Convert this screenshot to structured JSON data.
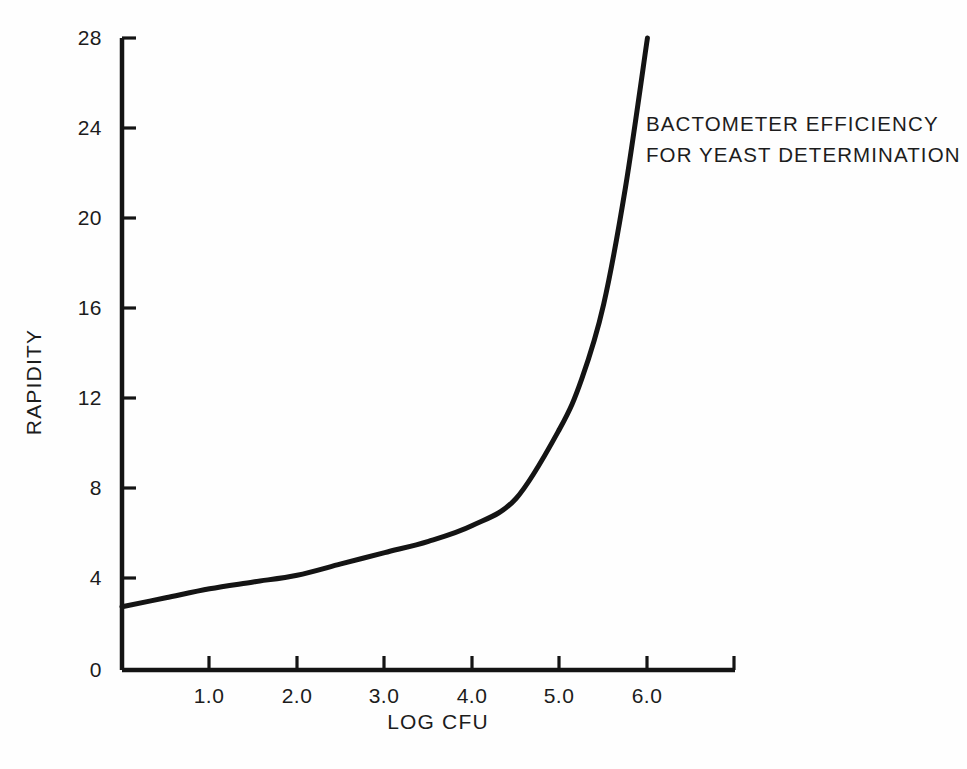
{
  "chart_data": {
    "type": "line",
    "title": "",
    "annotation_lines": [
      "BACTOMETER EFFICIENCY",
      "FOR YEAST DETERMINATION"
    ],
    "xlabel": "LOG CFU",
    "ylabel": "RAPIDITY",
    "xlim": [
      0.0,
      7.0
    ],
    "ylim": [
      0,
      28
    ],
    "grid": false,
    "legend": false,
    "xticks": [
      "1.0",
      "2.0",
      "3.0",
      "4.0",
      "5.0",
      "6.0"
    ],
    "xtick_values": [
      1.0,
      2.0,
      3.0,
      4.0,
      5.0,
      6.0
    ],
    "yticks": [
      "0",
      "4",
      "8",
      "12",
      "16",
      "20",
      "24",
      "28"
    ],
    "ytick_values": [
      0,
      4,
      8,
      12,
      16,
      20,
      24,
      28
    ],
    "series": [
      {
        "name": "Bactometer efficiency for yeast determination",
        "color": "#141414",
        "x": [
          0.0,
          0.5,
          1.0,
          1.5,
          2.0,
          2.5,
          3.0,
          3.5,
          4.0,
          4.5,
          5.0,
          5.25,
          5.5,
          5.75,
          6.0
        ],
        "values": [
          2.8,
          3.2,
          3.6,
          3.9,
          4.2,
          4.7,
          5.2,
          5.7,
          6.4,
          7.6,
          10.7,
          12.9,
          16.2,
          21.4,
          28.0
        ]
      }
    ]
  },
  "axes": {
    "y_title": "RAPIDITY",
    "x_title": "LOG CFU"
  }
}
